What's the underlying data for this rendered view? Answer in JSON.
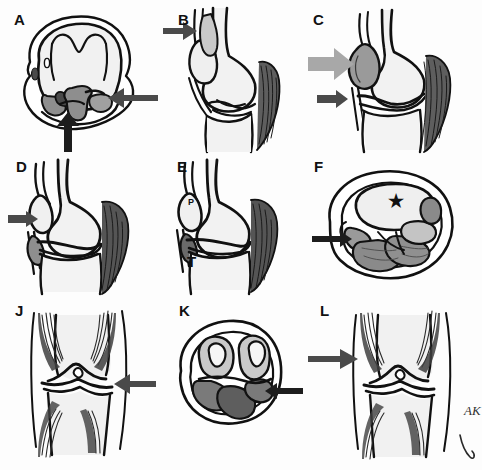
{
  "figure": {
    "background_color": "#fdfdfd",
    "grid": {
      "rows": 3,
      "cols": 3
    },
    "signature": "AK",
    "colors": {
      "outline": "#111111",
      "bone_fill": "#f0f0f0",
      "soft_tissue_gray": "#8e8e8e",
      "dark_tissue": "#5a5a5a",
      "muscle_hatch": "#3a3a3a",
      "arrow_dark": "#4a4a4a",
      "arrow_gray": "#a8a8a8",
      "star": "#111111"
    }
  },
  "panels": [
    {
      "id": "A",
      "label": "A",
      "view": "axial",
      "markers": [],
      "arrows": [
        {
          "name": "arrow-right-dark",
          "color": "#4a4a4a",
          "direction": "left",
          "size": "large"
        },
        {
          "name": "arrow-bottom-dark",
          "color": "#4a4a4a",
          "direction": "up",
          "size": "large"
        }
      ]
    },
    {
      "id": "B",
      "label": "B",
      "view": "sagittal",
      "markers": [],
      "arrows": [
        {
          "name": "arrow-left-dark",
          "color": "#4a4a4a",
          "direction": "right",
          "size": "medium"
        }
      ]
    },
    {
      "id": "C",
      "label": "C",
      "view": "sagittal",
      "markers": [],
      "arrows": [
        {
          "name": "arrow-left-gray",
          "color": "#a8a8a8",
          "direction": "right",
          "size": "large"
        },
        {
          "name": "arrow-left-dark",
          "color": "#4a4a4a",
          "direction": "right",
          "size": "small"
        }
      ]
    },
    {
      "id": "D",
      "label": "D",
      "view": "sagittal",
      "markers": [],
      "arrows": [
        {
          "name": "arrow-left-dark",
          "color": "#4a4a4a",
          "direction": "right",
          "size": "thin"
        }
      ]
    },
    {
      "id": "E",
      "label": "E",
      "view": "sagittal",
      "markers": [
        {
          "name": "label-patella",
          "text": "P",
          "font_size": 9
        },
        {
          "name": "label-tibia",
          "text": "T",
          "font_size": 14
        }
      ],
      "arrows": []
    },
    {
      "id": "F",
      "label": "F",
      "view": "axial",
      "markers": [
        {
          "name": "star-marker",
          "text": "★",
          "font_size": 17
        }
      ],
      "arrows": [
        {
          "name": "arrow-left-dark",
          "color": "#1d1d1d",
          "direction": "right",
          "size": "thin"
        }
      ]
    },
    {
      "id": "J",
      "label": "J",
      "view": "frontal",
      "markers": [],
      "arrows": [
        {
          "name": "arrow-right-dark",
          "color": "#4a4a4a",
          "direction": "left",
          "size": "large"
        }
      ]
    },
    {
      "id": "K",
      "label": "K",
      "view": "axial",
      "markers": [],
      "arrows": [
        {
          "name": "arrow-right-dark",
          "color": "#1d1d1d",
          "direction": "left",
          "size": "thin"
        }
      ]
    },
    {
      "id": "L",
      "label": "L",
      "view": "frontal",
      "markers": [],
      "arrows": [
        {
          "name": "arrow-left-dark",
          "color": "#4a4a4a",
          "direction": "right",
          "size": "large"
        }
      ]
    }
  ]
}
